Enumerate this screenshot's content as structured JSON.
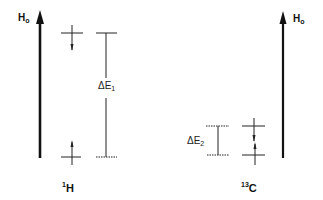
{
  "diagram": {
    "title": "",
    "field_axis": {
      "symbol": "H",
      "subscript": "o"
    },
    "nuclei": [
      {
        "id": "1H",
        "mass_number": "1",
        "element": "H",
        "gap_label": {
          "symbol": "ΔE",
          "subscript": "1"
        },
        "upper_level_spin": "down",
        "lower_level_spin": "up",
        "gap_size": "large"
      },
      {
        "id": "13C",
        "mass_number": "13",
        "element": "C",
        "gap_label": {
          "symbol": "ΔE",
          "subscript": "2"
        },
        "upper_level_spin": "down",
        "lower_level_spin": "up",
        "gap_size": "small"
      }
    ],
    "colors": {
      "line": "#111111",
      "background": "#ffffff"
    }
  }
}
